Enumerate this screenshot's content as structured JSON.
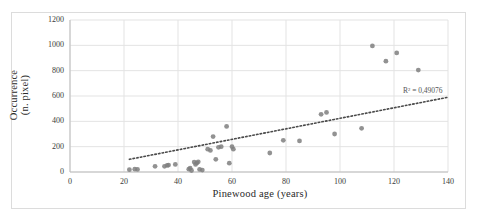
{
  "chart_data": {
    "type": "scatter",
    "title": "",
    "xlabel": "Pinewood age (years)",
    "ylabel": "Occurrence\n(n. pixel)",
    "ylabel_line1": "Occurrence",
    "ylabel_line2": "(n. pixel)",
    "xlim": [
      0,
      140
    ],
    "ylim": [
      0,
      1200
    ],
    "xticks": [
      0,
      20,
      40,
      60,
      80,
      100,
      120,
      140
    ],
    "yticks": [
      0,
      200,
      400,
      600,
      800,
      1000,
      1200
    ],
    "grid": true,
    "legend": "none",
    "marker_color": "#7f7f7f",
    "trendline": {
      "style": "dotted",
      "color": "#4a4a4a",
      "x_start": 22,
      "y_start": 100,
      "x_end": 140,
      "y_end": 590
    },
    "annotation": "R² = 0,49076",
    "points": [
      {
        "x": 22,
        "y": 18
      },
      {
        "x": 24,
        "y": 22
      },
      {
        "x": 25,
        "y": 20
      },
      {
        "x": 31.5,
        "y": 45
      },
      {
        "x": 35,
        "y": 45
      },
      {
        "x": 36,
        "y": 52
      },
      {
        "x": 36.5,
        "y": 55
      },
      {
        "x": 39,
        "y": 60
      },
      {
        "x": 44,
        "y": 22
      },
      {
        "x": 44.5,
        "y": 30
      },
      {
        "x": 45,
        "y": 12
      },
      {
        "x": 46,
        "y": 78
      },
      {
        "x": 46.5,
        "y": 60
      },
      {
        "x": 47,
        "y": 72
      },
      {
        "x": 47.5,
        "y": 80
      },
      {
        "x": 48,
        "y": 20
      },
      {
        "x": 49,
        "y": 15
      },
      {
        "x": 51,
        "y": 180
      },
      {
        "x": 52,
        "y": 170
      },
      {
        "x": 53,
        "y": 280
      },
      {
        "x": 54,
        "y": 100
      },
      {
        "x": 55,
        "y": 195
      },
      {
        "x": 56,
        "y": 200
      },
      {
        "x": 58,
        "y": 360
      },
      {
        "x": 59,
        "y": 70
      },
      {
        "x": 60,
        "y": 200
      },
      {
        "x": 60.5,
        "y": 180
      },
      {
        "x": 74,
        "y": 150
      },
      {
        "x": 79,
        "y": 250
      },
      {
        "x": 85,
        "y": 245
      },
      {
        "x": 93,
        "y": 455
      },
      {
        "x": 95,
        "y": 470
      },
      {
        "x": 98,
        "y": 300
      },
      {
        "x": 108,
        "y": 345
      },
      {
        "x": 112,
        "y": 995
      },
      {
        "x": 117,
        "y": 875
      },
      {
        "x": 121,
        "y": 940
      },
      {
        "x": 129,
        "y": 805
      }
    ]
  }
}
